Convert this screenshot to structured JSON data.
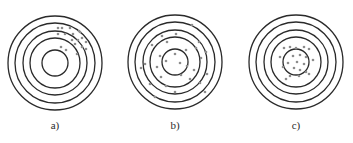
{
  "figure": {
    "type": "concentric-target-diagram",
    "colors": {
      "background": "#ffffff",
      "ring": "#2a2a2a",
      "dot": "#8c8c8c"
    },
    "ring_stroke_width": 1.3,
    "dot_radius": 1.3,
    "panels": [
      {
        "id": "a",
        "label": "a)",
        "center": [
          55,
          63
        ],
        "radii": [
          47,
          40,
          32,
          25,
          13
        ],
        "dots": [
          [
            58,
            28
          ],
          [
            62,
            28
          ],
          [
            70,
            28
          ],
          [
            79,
            31
          ],
          [
            58,
            34
          ],
          [
            65,
            34
          ],
          [
            73,
            34
          ],
          [
            80,
            32
          ],
          [
            72,
            40
          ],
          [
            78,
            40
          ],
          [
            82,
            38
          ],
          [
            86,
            42
          ],
          [
            61,
            47
          ],
          [
            66,
            50
          ],
          [
            75,
            44
          ],
          [
            82,
            47
          ],
          [
            86,
            49
          ],
          [
            77,
            54
          ]
        ]
      },
      {
        "id": "b",
        "label": "b)",
        "center": [
          175,
          62
        ],
        "radii": [
          47,
          40,
          32,
          25,
          13
        ],
        "dots": [
          [
            192,
            25
          ],
          [
            162,
            36
          ],
          [
            176,
            34
          ],
          [
            167,
            42
          ],
          [
            199,
            42
          ],
          [
            152,
            45
          ],
          [
            196,
            48
          ],
          [
            206,
            52
          ],
          [
            186,
            50
          ],
          [
            175,
            54
          ],
          [
            160,
            56
          ],
          [
            201,
            58
          ],
          [
            145,
            64
          ],
          [
            166,
            61
          ],
          [
            180,
            63
          ],
          [
            157,
            67
          ],
          [
            187,
            66
          ],
          [
            194,
            70
          ],
          [
            141,
            68
          ],
          [
            207,
            74
          ],
          [
            161,
            77
          ],
          [
            181,
            75
          ],
          [
            190,
            79
          ],
          [
            150,
            84
          ],
          [
            166,
            86
          ],
          [
            200,
            83
          ],
          [
            205,
            92
          ],
          [
            175,
            92
          ],
          [
            155,
            97
          ]
        ]
      },
      {
        "id": "c",
        "label": "c)",
        "center": [
          296,
          62
        ],
        "radii": [
          47,
          40,
          32,
          25,
          13
        ],
        "dots": [
          [
            284,
            48
          ],
          [
            290,
            47
          ],
          [
            296,
            48
          ],
          [
            304,
            47
          ],
          [
            309,
            49
          ],
          [
            280,
            57
          ],
          [
            293,
            56
          ],
          [
            300,
            55
          ],
          [
            306,
            57
          ],
          [
            313,
            60
          ],
          [
            288,
            63
          ],
          [
            297,
            62
          ],
          [
            304,
            64
          ],
          [
            283,
            67
          ],
          [
            294,
            68
          ],
          [
            300,
            70
          ],
          [
            306,
            72
          ],
          [
            290,
            76
          ],
          [
            299,
            76
          ],
          [
            309,
            74
          ],
          [
            286,
            79
          ]
        ]
      }
    ]
  }
}
